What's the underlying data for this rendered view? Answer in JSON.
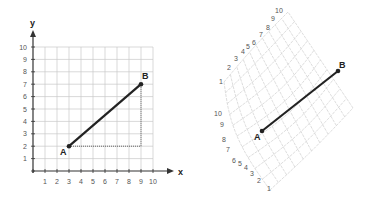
{
  "left_diagram": {
    "x_axis_label": "x",
    "y_axis_label": "y",
    "x_ticks": [
      "1",
      "2",
      "3",
      "4",
      "5",
      "6",
      "7",
      "8",
      "9",
      "10"
    ],
    "y_ticks": [
      "1",
      "2",
      "3",
      "4",
      "5",
      "6",
      "7",
      "8",
      "9",
      "10"
    ],
    "point_a": {
      "label": "A",
      "x": 3,
      "y": 2
    },
    "point_b": {
      "label": "B",
      "x": 9,
      "y": 7
    },
    "segment_color": "#222222",
    "grid_color": "#c8c8c8",
    "guide_color": "#444444"
  },
  "right_diagram": {
    "upper_arc_labels": [
      "1",
      "2",
      "3",
      "4",
      "5",
      "6",
      "7",
      "8",
      "9",
      "10"
    ],
    "lower_arc_labels": [
      "10",
      "9",
      "8",
      "7",
      "6",
      "5",
      "4",
      "3",
      "2",
      "1"
    ],
    "point_a": {
      "label": "A"
    },
    "point_b": {
      "label": "B"
    }
  },
  "chart_data": {
    "type": "scatter",
    "title": "",
    "xlabel": "x",
    "ylabel": "y",
    "xlim": [
      0,
      10
    ],
    "ylim": [
      0,
      10
    ],
    "x": [
      3,
      9
    ],
    "y": [
      2,
      7
    ],
    "point_labels": [
      "A",
      "B"
    ],
    "grid": true,
    "annotations": [
      "segment AB",
      "dotted right-triangle legs from A to (9,2) to B",
      "right panel: same segment AB drawn on a warped/curved grid"
    ]
  }
}
